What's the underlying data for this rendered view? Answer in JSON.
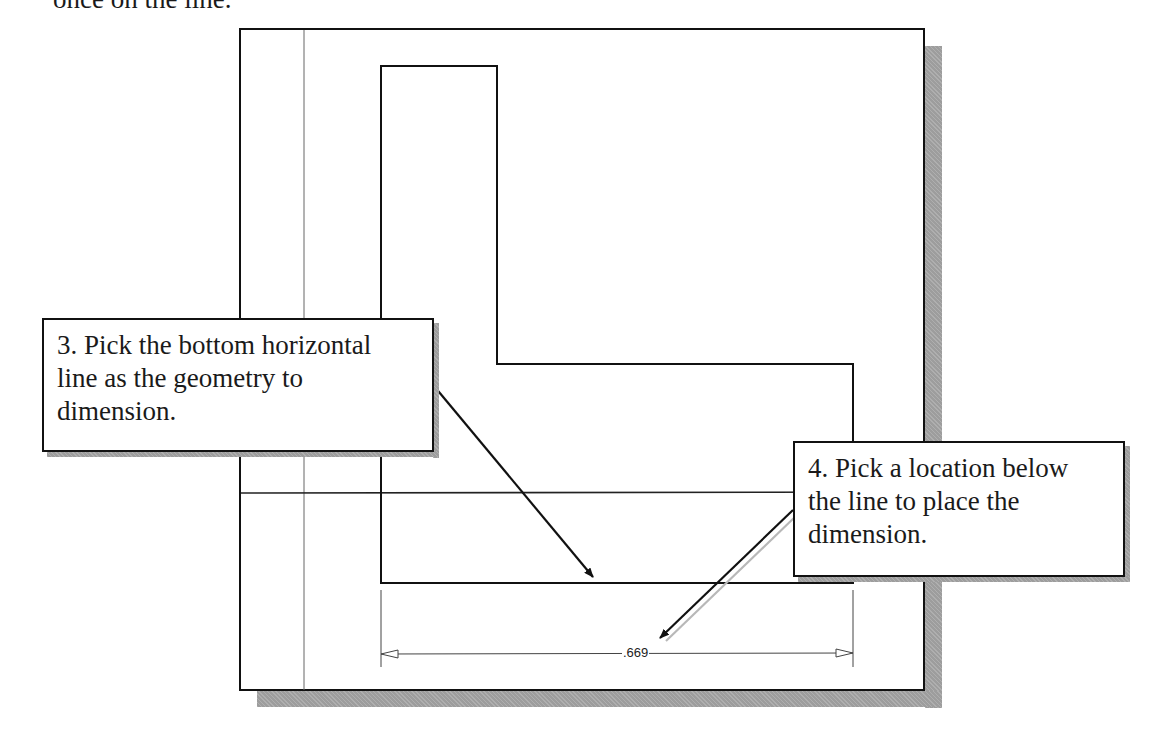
{
  "page": {
    "top_text": "once on the line."
  },
  "drawing": {
    "dimension_value": ".669",
    "colors": {
      "line": "#111111",
      "thin_line": "#555555",
      "shadow": "#9d9d9d"
    }
  },
  "callouts": [
    {
      "step": "3",
      "lines": [
        "3. Pick the bottom horizontal",
        "line as the geometry to",
        "dimension."
      ]
    },
    {
      "step": "4",
      "lines": [
        "4. Pick a location below",
        "the line to place the",
        "dimension."
      ]
    }
  ]
}
